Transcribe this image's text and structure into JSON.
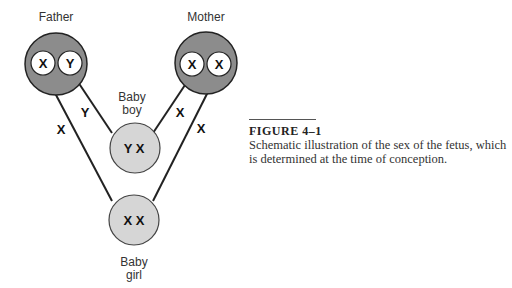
{
  "diagram": {
    "father": {
      "label": "Father",
      "chromosomes": [
        "X",
        "Y"
      ]
    },
    "mother": {
      "label": "Mother",
      "chromosomes": [
        "X",
        "X"
      ]
    },
    "baby_boy": {
      "label_line1": "Baby",
      "label_line2": "boy",
      "chromosomes": "Y X"
    },
    "baby_girl": {
      "label_line1": "Baby",
      "label_line2": "girl",
      "chromosomes": "X X"
    },
    "edge_labels": {
      "father_y_to_boy": "Y",
      "father_x_to_girl": "X",
      "mother_x_to_boy": "X",
      "mother_x_to_girl": "X"
    },
    "colors": {
      "parent_fill": "#8c8c8c",
      "child_fill": "#d6d6d6",
      "gamete_fill": "#ffffff",
      "stroke": "#222222"
    }
  },
  "caption": {
    "title": "FIGURE 4–1",
    "text": "Schematic illustration of the sex of the fetus, which is determined at the time of conception."
  }
}
